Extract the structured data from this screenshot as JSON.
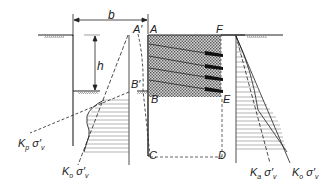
{
  "figure": {
    "dimension_labels": {
      "width": "b",
      "height": "h"
    },
    "points": {
      "A_prime": "A′",
      "A": "A",
      "B_prime": "B′",
      "B": "B",
      "C": "C",
      "D": "D",
      "E": "E",
      "F": "F"
    },
    "pressure_labels": {
      "left_passive": {
        "K": "K",
        "sub": "p",
        "sigma": "σ′",
        "v": "v"
      },
      "left_at_rest": {
        "K": "K",
        "sub": "o",
        "sigma": "σ′",
        "v": "v"
      },
      "right_active": {
        "K": "K",
        "sub": "a",
        "sigma": "σ′",
        "v": "v"
      },
      "right_at_rest": {
        "K": "K",
        "sub": "o",
        "sigma": "σ′",
        "v": "v"
      }
    },
    "colors": {
      "line": "#222222",
      "hatch_fill": "#b8b8b8",
      "anchor": "#111111"
    }
  }
}
